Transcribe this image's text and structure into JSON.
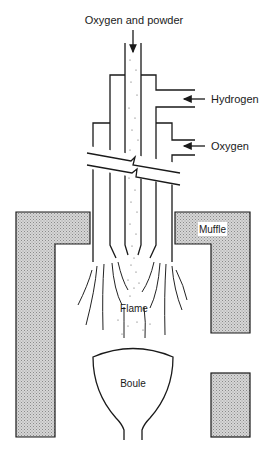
{
  "labels": {
    "feed": "Oxygen and powder",
    "hydrogen": "Hydrogen",
    "oxygen": "Oxygen",
    "muffle": "Muffle",
    "flame": "Flame",
    "boule": "Boule"
  },
  "colors": {
    "line": "#1a1a1a",
    "muffle_fill": "#bdbdbd",
    "background": "#ffffff"
  }
}
